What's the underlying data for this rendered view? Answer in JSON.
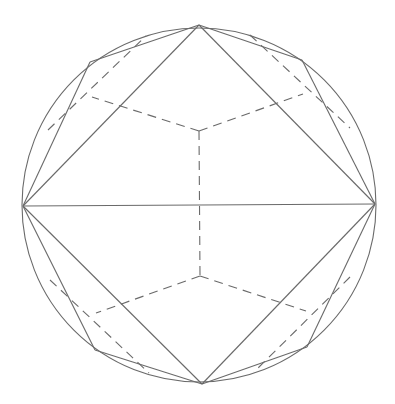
{
  "figure": {
    "title": "",
    "stroke_color": "#6a6a6a",
    "background": "#ffffff",
    "circle": {
      "cx": 199,
      "cy": 205,
      "r": 177
    },
    "vertices": {
      "top": [
        199,
        25
      ],
      "bottom": [
        202,
        384
      ],
      "left": [
        23,
        206
      ],
      "right": [
        375,
        204
      ],
      "upper_left": [
        90,
        62
      ],
      "upper_right": [
        302,
        60
      ],
      "lower_left": [
        95,
        350
      ],
      "lower_right": [
        307,
        347
      ]
    },
    "hidden_vertices": {
      "inner_top": [
        199,
        131
      ],
      "inner_bottom": [
        200,
        276
      ],
      "inner_upper_left": [
        92,
        97
      ],
      "inner_upper_right": [
        303,
        94
      ],
      "inner_lower_left": [
        96,
        313
      ],
      "inner_lower_right": [
        306,
        311
      ]
    }
  }
}
